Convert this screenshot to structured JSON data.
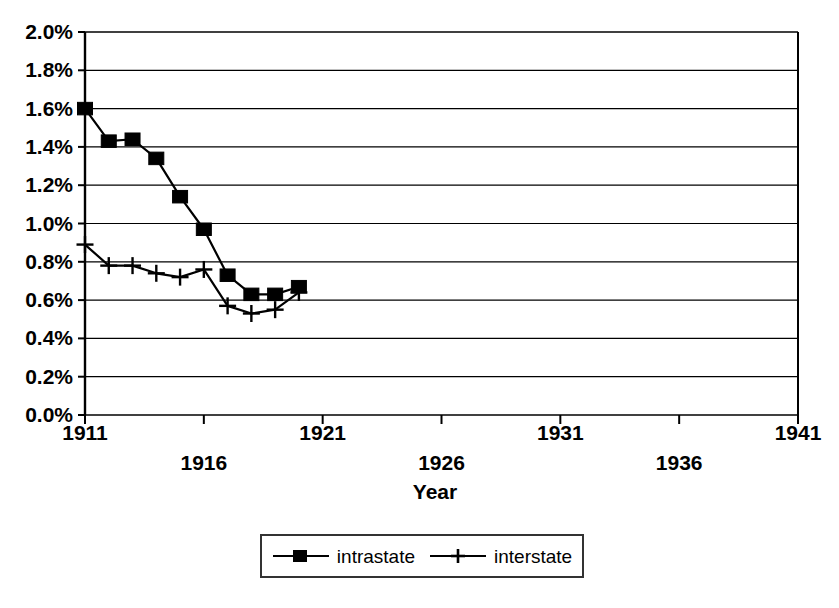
{
  "chart_data": {
    "type": "line",
    "title": "",
    "xlabel": "Year",
    "ylabel": "",
    "xlim": [
      1911,
      1941
    ],
    "ylim": [
      0.0,
      2.0
    ],
    "grid": true,
    "grid_axis": "y",
    "legend_position": "bottom",
    "y_tick_labels": [
      "2.0%",
      "1.8%",
      "1.6%",
      "1.4%",
      "1.2%",
      "1.0%",
      "0.8%",
      "0.6%",
      "0.4%",
      "0.2%",
      "0.0%"
    ],
    "y_tick_values": [
      2.0,
      1.8,
      1.6,
      1.4,
      1.2,
      1.0,
      0.8,
      0.6,
      0.4,
      0.2,
      0.0
    ],
    "x_tick_values": [
      1911,
      1916,
      1921,
      1926,
      1931,
      1936,
      1941
    ],
    "x_tick_labels": [
      "1911",
      "1916",
      "1921",
      "1926",
      "1931",
      "1936",
      "1941"
    ],
    "x": [
      1911,
      1912,
      1913,
      1914,
      1915,
      1916,
      1917,
      1918,
      1919,
      1920
    ],
    "series": [
      {
        "name": "intrastate",
        "marker": "square",
        "color": "#000000",
        "values": [
          1.6,
          1.43,
          1.44,
          1.34,
          1.14,
          0.97,
          0.73,
          0.63,
          0.63,
          0.67
        ]
      },
      {
        "name": "interstate",
        "marker": "plus",
        "color": "#000000",
        "values": [
          0.89,
          0.78,
          0.78,
          0.74,
          0.72,
          0.76,
          0.57,
          0.53,
          0.55,
          0.64
        ]
      }
    ]
  },
  "axes": {
    "x_axis_title": "Year"
  },
  "legend": {
    "entries": [
      {
        "label": "intrastate"
      },
      {
        "label": "interstate"
      }
    ]
  }
}
